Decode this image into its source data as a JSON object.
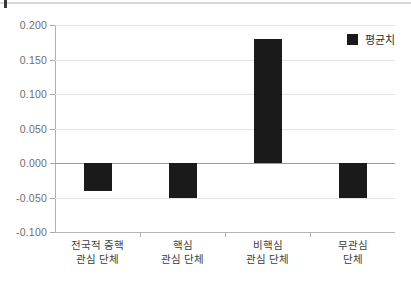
{
  "chart_data": {
    "type": "bar",
    "title": "",
    "subtitle": "",
    "xlabel": "",
    "ylabel": "",
    "categories": [
      "전국적 중핵\n관심 단체",
      "핵심\n관심 단체",
      "비핵심\n관심 단체",
      "무관심\n단체"
    ],
    "category_lines": [
      [
        "전국적 중핵",
        "관심 단체"
      ],
      [
        "핵심",
        "관심 단체"
      ],
      [
        "비핵심",
        "관심 단체"
      ],
      [
        "무관심",
        "단체"
      ]
    ],
    "series": [
      {
        "name": "평균치",
        "values": [
          -0.04,
          -0.05,
          0.18,
          -0.05
        ],
        "color": "#1a1a1a"
      }
    ],
    "ylim": [
      -0.1,
      0.2
    ],
    "ytick_values": [
      0.2,
      0.15,
      0.1,
      0.05,
      0.0,
      -0.05,
      -0.1
    ],
    "ytick_labels": [
      "0.200",
      "0.150",
      "0.100",
      "0.050",
      "0.000",
      "-0.050",
      "-0.100"
    ],
    "grid": true,
    "grid_axis": "y",
    "legend": {
      "position": "top-right",
      "entries": [
        {
          "label": "평균치",
          "marker": "filled-square",
          "color": "#1a1a1a"
        }
      ]
    },
    "colors": {
      "bar": "#1a1a1a",
      "grid": "#e4e4e4",
      "zero_line": "#9a9a9a",
      "axis": "#b0b0b0",
      "tick_label": "#6e6e6e",
      "category_label": "#3c3c3c",
      "background": "#ffffff"
    }
  }
}
